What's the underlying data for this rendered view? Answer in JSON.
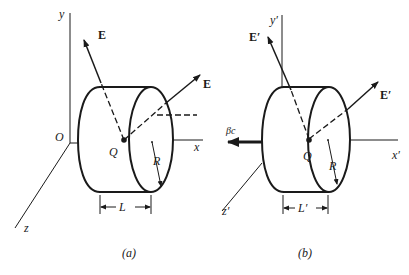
{
  "figure": {
    "panel_a": {
      "caption": "(a)",
      "axes": {
        "x": "x",
        "y": "y",
        "z": "z",
        "origin": "O"
      },
      "charge": "Q",
      "field_label_upper": "E",
      "field_label_right": "E",
      "radius": "R",
      "length": "L"
    },
    "panel_b": {
      "caption": "(b)",
      "axes": {
        "x": "x′",
        "y": "y′",
        "z": "z′"
      },
      "charge": "Q",
      "field_label_upper": "E′",
      "field_label_right": "E′",
      "radius": "R",
      "length": "L′",
      "velocity": "βc"
    },
    "colors": {
      "ink": "#1a1a1a",
      "background": "#ffffff"
    }
  }
}
